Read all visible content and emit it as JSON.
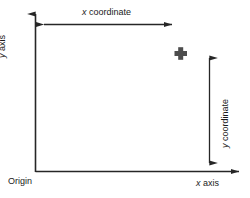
{
  "diagram": {
    "background_color": "#ffffff",
    "line_color": "#262626",
    "marker_color": "#4d4d4d",
    "labels": {
      "x_coordinate": "x coordinate",
      "y_coordinate": "y coordinate",
      "x_axis": "x axis",
      "y_axis": "y axis",
      "origin": "Origin"
    },
    "italic_prefix": {
      "x": "x",
      "y": "y"
    },
    "label_rest": {
      "coordinate": " coordinate",
      "axis": " axis"
    },
    "geometry": {
      "origin_point": [
        35,
        172
      ],
      "y_axis_top": [
        35,
        8
      ],
      "x_axis_right": [
        245,
        172
      ],
      "point_marker": [
        180,
        54
      ],
      "x_measure_line_y": 24,
      "x_measure_from": 36,
      "x_measure_to": 180,
      "y_measure_line_x": 209,
      "y_measure_from": 50,
      "y_measure_to": 171
    }
  }
}
